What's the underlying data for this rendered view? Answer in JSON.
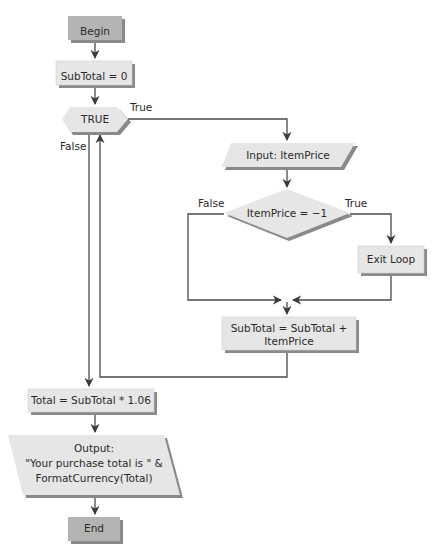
{
  "diagram": {
    "type": "flowchart",
    "nodes": {
      "begin": {
        "label": "Begin",
        "shape": "terminal"
      },
      "init": {
        "label": "SubTotal = 0",
        "shape": "process"
      },
      "loop": {
        "label": "TRUE",
        "shape": "loop-hexagon"
      },
      "input": {
        "label": "Input: ItemPrice",
        "shape": "io"
      },
      "decision": {
        "label": "ItemPrice = −1",
        "shape": "decision"
      },
      "exit": {
        "label": "Exit Loop",
        "shape": "process"
      },
      "accumulate": {
        "line1": "SubTotal = SubTotal +",
        "line2": "ItemPrice",
        "shape": "process"
      },
      "total": {
        "label": "Total = SubTotal * 1.06",
        "shape": "process"
      },
      "output": {
        "line1": "Output:",
        "line2": "\"Your purchase total is \" &",
        "line3": "FormatCurrency(Total)",
        "shape": "io"
      },
      "end": {
        "label": "End",
        "shape": "terminal"
      }
    },
    "edge_labels": {
      "loop_true": "True",
      "loop_false": "False",
      "decision_false": "False",
      "decision_true": "True"
    },
    "colors": {
      "terminal_fill": "#b4b4b4",
      "box_fill": "#e6e6e6",
      "shadow": "#8a8a8a",
      "line": "#4a4a4a"
    }
  }
}
